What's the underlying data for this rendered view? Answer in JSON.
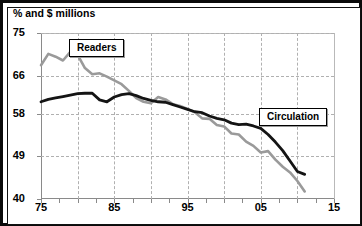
{
  "chart": {
    "title": "% and $ millions",
    "y_ticks": [
      "75",
      "66",
      "58",
      "49",
      "40"
    ],
    "x_ticks": [
      "75",
      "85",
      "95",
      "05",
      "15"
    ],
    "callouts": {
      "readers": "Readers",
      "circulation": "Circulation"
    },
    "colors": {
      "readers_line": "#9a9a9a",
      "circulation_line": "#141414",
      "grid": "#b0b0b0",
      "frame": "#0a0a0a",
      "background": "#ffffff"
    }
  },
  "chart_data": {
    "type": "line",
    "title": "% and $ millions",
    "xlabel": "",
    "ylabel": "% and $ millions",
    "xlim": [
      1975,
      2015
    ],
    "ylim": [
      40,
      75
    ],
    "yticks": [
      40,
      49,
      58,
      66,
      75
    ],
    "xticks": [
      1975,
      1985,
      1995,
      2005,
      2015
    ],
    "grid": true,
    "legend": "inline-callout",
    "x": [
      1975,
      1976,
      1977,
      1978,
      1979,
      1980,
      1981,
      1982,
      1983,
      1984,
      1985,
      1986,
      1987,
      1988,
      1989,
      1990,
      1991,
      1992,
      1993,
      1994,
      1995,
      1996,
      1997,
      1998,
      1999,
      2000,
      2001,
      2002,
      2003,
      2004,
      2005,
      2006,
      2007,
      2008,
      2009,
      2010,
      2011
    ],
    "series": [
      {
        "name": "Readers",
        "color": "#9a9a9a",
        "values": [
          68.2,
          70.6,
          70.0,
          69.2,
          71.0,
          70.4,
          67.6,
          66.3,
          66.5,
          65.8,
          65.0,
          64.2,
          62.8,
          61.3,
          60.5,
          60.2,
          61.5,
          61.0,
          60.0,
          59.6,
          59.0,
          58.3,
          57.0,
          56.9,
          55.6,
          55.3,
          53.8,
          53.6,
          52.1,
          51.2,
          49.8,
          50.1,
          48.3,
          46.8,
          45.6,
          43.8,
          41.6
        ]
      },
      {
        "name": "Circulation",
        "color": "#141414",
        "values": [
          60.5,
          61.0,
          61.3,
          61.6,
          61.9,
          62.2,
          62.3,
          62.3,
          60.9,
          60.5,
          61.5,
          62.0,
          62.2,
          61.8,
          61.2,
          60.8,
          60.5,
          60.4,
          59.9,
          59.4,
          58.9,
          58.4,
          58.2,
          57.5,
          57.0,
          56.7,
          56.0,
          55.7,
          55.8,
          55.4,
          54.9,
          53.6,
          52.0,
          50.2,
          48.0,
          45.8,
          45.2
        ]
      }
    ]
  }
}
